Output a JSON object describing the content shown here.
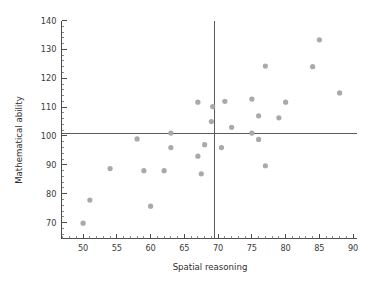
{
  "chart_data": {
    "type": "scatter",
    "title": "",
    "xlabel": "Spatial reasoning",
    "ylabel": "Mathematical ability",
    "xlim": [
      46.8,
      90.5
    ],
    "ylim": [
      64.5,
      140
    ],
    "x_ticks": [
      50,
      55,
      60,
      65,
      70,
      75,
      80,
      85,
      90
    ],
    "y_ticks": [
      70,
      80,
      90,
      100,
      110,
      120,
      130,
      140
    ],
    "x_tick_labels": [
      "50",
      "55",
      "60",
      "65",
      "70",
      "75",
      "80",
      "85",
      "90"
    ],
    "y_tick_labels": [
      "70",
      "80",
      "90",
      "100",
      "110",
      "120",
      "130",
      "140"
    ],
    "x_minor_step": 1,
    "y_minor_step": 2,
    "grid": false,
    "legend": "none",
    "point_color": "#a9a9a9",
    "point_radius": 2.6,
    "reference_lines": [
      {
        "orientation": "vertical",
        "value": 69.4,
        "label": "mean spatial reasoning",
        "color": "#5a5a5a"
      },
      {
        "orientation": "horizontal",
        "value": 100.8,
        "label": "mean mathematical ability",
        "color": "#5a5a5a"
      }
    ],
    "points": [
      {
        "x": 50.0,
        "y": 69.8
      },
      {
        "x": 51.0,
        "y": 77.8
      },
      {
        "x": 54.0,
        "y": 88.7
      },
      {
        "x": 58.0,
        "y": 99.0
      },
      {
        "x": 59.0,
        "y": 88.0
      },
      {
        "x": 60.0,
        "y": 75.7
      },
      {
        "x": 62.0,
        "y": 88.0
      },
      {
        "x": 63.0,
        "y": 96.0
      },
      {
        "x": 63.0,
        "y": 101.0
      },
      {
        "x": 67.0,
        "y": 93.0
      },
      {
        "x": 67.0,
        "y": 111.7
      },
      {
        "x": 67.5,
        "y": 86.9
      },
      {
        "x": 68.0,
        "y": 97.0
      },
      {
        "x": 69.0,
        "y": 105.0
      },
      {
        "x": 69.2,
        "y": 110.2
      },
      {
        "x": 70.5,
        "y": 96.0
      },
      {
        "x": 71.0,
        "y": 112.0
      },
      {
        "x": 72.0,
        "y": 103.0
      },
      {
        "x": 75.0,
        "y": 101.0
      },
      {
        "x": 75.0,
        "y": 112.8
      },
      {
        "x": 76.0,
        "y": 98.8
      },
      {
        "x": 76.0,
        "y": 107.0
      },
      {
        "x": 77.0,
        "y": 89.7
      },
      {
        "x": 77.0,
        "y": 124.2
      },
      {
        "x": 79.0,
        "y": 106.3
      },
      {
        "x": 80.0,
        "y": 111.7
      },
      {
        "x": 84.0,
        "y": 124.0
      },
      {
        "x": 85.0,
        "y": 133.3
      },
      {
        "x": 88.0,
        "y": 114.9
      }
    ]
  }
}
